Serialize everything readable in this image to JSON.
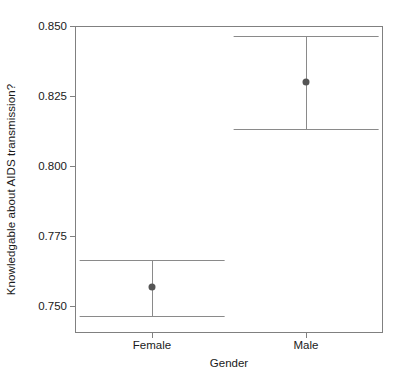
{
  "chart_data": {
    "type": "scatter",
    "title": "",
    "xlabel": "Gender",
    "ylabel": "Knowledgable about AIDS transmission?",
    "categories": [
      "Female",
      "Male"
    ],
    "yticks": [
      "0.750",
      "0.775",
      "0.800",
      "0.825",
      "0.850"
    ],
    "ytick_values": [
      0.75,
      0.775,
      0.8,
      0.825,
      0.85
    ],
    "ylim": [
      0.7405,
      0.85
    ],
    "grid": false,
    "legend": null,
    "series": [
      {
        "name": "Mean with 95% CI",
        "values": [
          0.757,
          0.83
        ],
        "ci_lower": [
          0.7465,
          0.8133
        ],
        "ci_upper": [
          0.7665,
          0.8465
        ]
      }
    ],
    "points": [
      {
        "category": "Female",
        "mean": 0.757,
        "ci_lower": 0.7465,
        "ci_upper": 0.8465
      },
      {
        "category": "Male",
        "mean": 0.83,
        "ci_lower": 0.8133,
        "ci_upper": 0.8465
      }
    ],
    "marker_color": "#555555",
    "errorbar_color": "#8a8a8a",
    "frame_color": "#808080"
  }
}
